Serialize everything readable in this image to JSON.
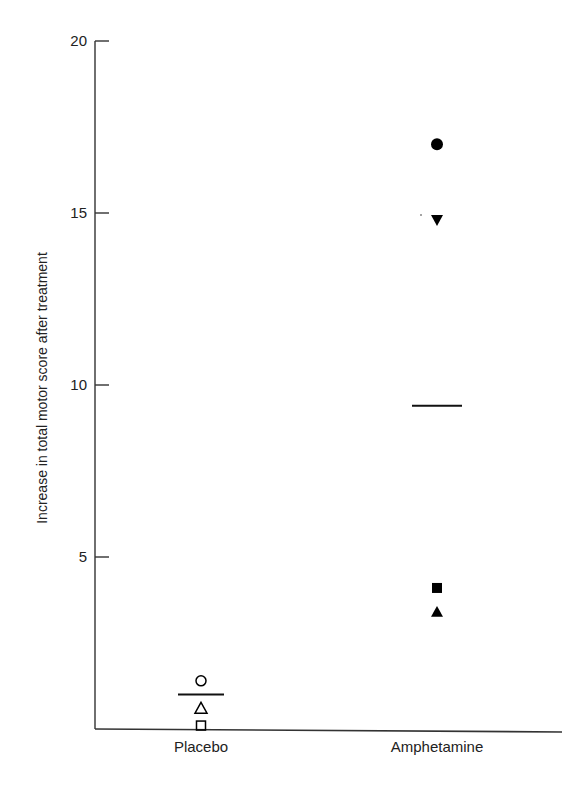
{
  "chart_data": {
    "type": "scatter",
    "title": "",
    "xlabel": "",
    "ylabel": "Increase in total motor score after treatment",
    "ylim": [
      0,
      20
    ],
    "yticks": [
      5,
      10,
      15,
      20
    ],
    "grid": false,
    "legend": null,
    "categories": [
      "Placebo",
      "Amphetamine"
    ],
    "series": [
      {
        "name": "Placebo",
        "points": [
          {
            "marker": "open-circle",
            "value": 1.4
          },
          {
            "marker": "open-triangle-up",
            "value": 0.6
          },
          {
            "marker": "open-square",
            "value": 0.1
          }
        ],
        "mean": 1.0
      },
      {
        "name": "Amphetamine",
        "points": [
          {
            "marker": "filled-circle",
            "value": 17.0
          },
          {
            "marker": "filled-triangle-down",
            "value": 14.8
          },
          {
            "marker": "filled-square",
            "value": 4.1
          },
          {
            "marker": "filled-triangle-up",
            "value": 3.4
          }
        ],
        "mean": 9.4
      }
    ]
  },
  "layout": {
    "axis_color": "#333333",
    "marker_color": "#000000",
    "plot": {
      "x0": 95,
      "x1": 562,
      "y_zero": 729,
      "px_per_unit": 34.4
    },
    "category_x": [
      201,
      437
    ],
    "mean_halfwidth": [
      23,
      25
    ]
  }
}
